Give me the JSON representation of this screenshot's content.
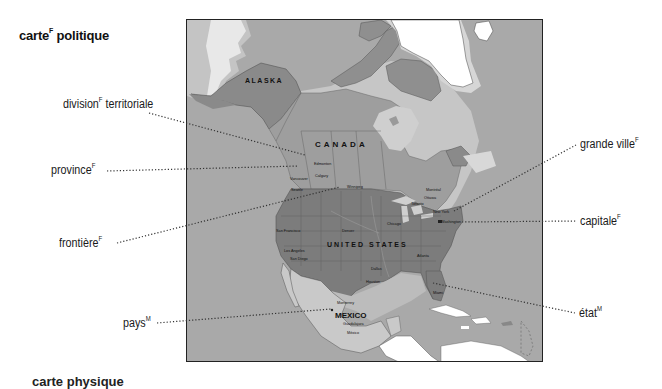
{
  "title": {
    "main": "carte",
    "gender": "F",
    "rest": " politique"
  },
  "labels": [
    {
      "id": "division-territoriale",
      "text": "division",
      "gender": "F",
      "suffix": " territoriale",
      "side": "left"
    },
    {
      "id": "province",
      "text": "province",
      "gender": "F",
      "suffix": "",
      "side": "left"
    },
    {
      "id": "frontiere",
      "text": "frontière",
      "gender": "F",
      "suffix": "",
      "side": "left"
    },
    {
      "id": "pays",
      "text": "pays",
      "gender": "M",
      "suffix": "",
      "side": "left"
    },
    {
      "id": "grande-ville",
      "text": "grande ville",
      "gender": "F",
      "suffix": "",
      "side": "right"
    },
    {
      "id": "capitale",
      "text": "capitale",
      "gender": "F",
      "suffix": "",
      "side": "right"
    },
    {
      "id": "etat",
      "text": "état",
      "gender": "M",
      "suffix": "",
      "side": "right"
    }
  ],
  "map": {
    "regions": {
      "alaska": "ALASKA",
      "canada": "CANADA",
      "united_states": "UNITED STATES",
      "mexico": "MEXICO"
    },
    "cities": {
      "edmonton": "Edmonton",
      "calgary": "Calgary",
      "vancouver": "Vancouver",
      "seattle": "Seattle",
      "winnipeg": "Winnipeg",
      "montreal": "Montréal",
      "ottawa": "Ottawa",
      "toronto": "Toronto",
      "new_york": "New York",
      "washington": "Washington",
      "chicago": "Chicago",
      "denver": "Denver",
      "san_francisco": "San Francisco",
      "los_angeles": "Los Angeles",
      "san_diego": "San Diego",
      "dallas": "Dallas",
      "houston": "Houston",
      "atlanta": "Atlanta",
      "miami": "Miami",
      "monterrey": "Monterrey",
      "guadalajara": "Guadalajara",
      "mexico_city": "México"
    },
    "colors": {
      "ocean": "#a9a9a9",
      "coast": "#c8c8c8",
      "canada": "#9d9d9d",
      "alaska": "#8a8a8a",
      "usa": "#7c7c7c",
      "mexico": "#c9c9c9",
      "greenland": "#ffffff",
      "frame": "#222222",
      "leader": "#333333"
    }
  },
  "footer": {
    "cut_text": "carte physique"
  }
}
